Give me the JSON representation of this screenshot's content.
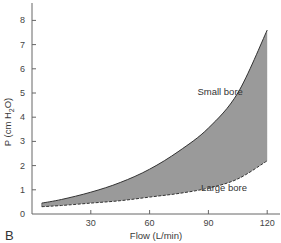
{
  "panel_label": "B",
  "colors": {
    "fill": "#9a9a9a",
    "axis": "#666666",
    "curve": "#333333"
  },
  "chart_data": {
    "type": "area",
    "title": "",
    "xlabel": "Flow (L/min)",
    "ylabel": "P (cm H2O)",
    "ylabel_parts": {
      "main": "P (cm H",
      "sub": "2",
      "end": "O)"
    },
    "xlim": [
      0,
      126
    ],
    "ylim": [
      0,
      8.7
    ],
    "xticks": [
      30,
      60,
      90,
      120
    ],
    "yticks": [
      0,
      1,
      2,
      3,
      4,
      5,
      6,
      7,
      8
    ],
    "grid": false,
    "legend": null,
    "x": [
      5,
      15,
      30,
      45,
      60,
      75,
      90,
      105,
      120
    ],
    "series": [
      {
        "name": "Small bore",
        "style": "solid",
        "values": [
          0.45,
          0.6,
          0.9,
          1.3,
          1.85,
          2.6,
          3.55,
          5.0,
          7.6
        ]
      },
      {
        "name": "Large bore",
        "style": "dashed",
        "values": [
          0.3,
          0.35,
          0.45,
          0.55,
          0.7,
          0.85,
          1.07,
          1.45,
          2.2
        ]
      }
    ],
    "annotations": [
      {
        "text": "Small bore",
        "x": 96,
        "y": 4.9
      },
      {
        "text": "Large bore",
        "x": 98,
        "y": 0.95
      }
    ],
    "shaded_region": "between Small bore and Large bore curves"
  }
}
